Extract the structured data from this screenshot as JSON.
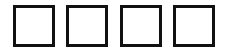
{
  "code_input": {
    "digits": [
      {
        "value": ""
      },
      {
        "value": ""
      },
      {
        "value": ""
      },
      {
        "value": ""
      }
    ],
    "border_color": "#111111",
    "background_color": "#ffffff"
  }
}
